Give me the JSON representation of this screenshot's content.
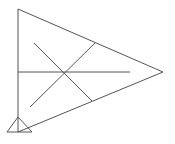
{
  "diagram": {
    "width": 175,
    "height": 144,
    "background": "#ffffff",
    "stroke_color": "#555555",
    "stroke_width": 1,
    "main_triangle": {
      "points": "18,9 163,72 18,132"
    },
    "lines": [
      {
        "name": "horizontal-median",
        "x1": 18,
        "y1": 72,
        "x2": 130,
        "y2": 72
      },
      {
        "name": "diagonal-down",
        "x1": 34,
        "y1": 43,
        "x2": 92,
        "y2": 101
      },
      {
        "name": "diagonal-up",
        "x1": 30,
        "y1": 107,
        "x2": 95,
        "y2": 43
      }
    ],
    "support_triangle": {
      "points": "18,117 7,132 32,132"
    }
  }
}
